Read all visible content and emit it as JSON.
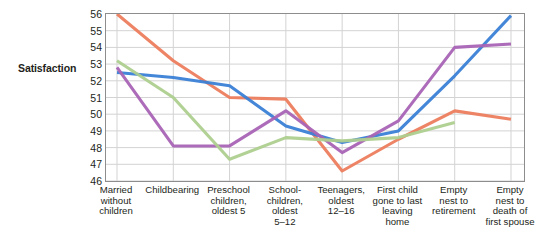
{
  "chart_data": {
    "type": "line",
    "title": "",
    "xlabel": "",
    "ylabel": "Satisfaction",
    "ylim": [
      46,
      56
    ],
    "yticks": [
      46,
      47,
      48,
      49,
      50,
      51,
      52,
      53,
      54,
      55,
      56
    ],
    "grid": true,
    "legend_position": "none",
    "categories": [
      "Married without children",
      "Childbearing",
      "Preschool children, oldest 5",
      "School-children, oldest 5–12",
      "Teenagers, oldest 12–16",
      "First child gone to last leaving home",
      "Empty nest to retirement",
      "Empty nest to death of first spouse"
    ],
    "category_lines": [
      [
        "Married",
        "without",
        "children"
      ],
      [
        "Childbearing"
      ],
      [
        "Preschool",
        "children,",
        "oldest 5"
      ],
      [
        "School-",
        "children,",
        "oldest",
        "5–12"
      ],
      [
        "Teenagers,",
        "oldest",
        "12–16"
      ],
      [
        "First child",
        "gone to last",
        "leaving",
        "home"
      ],
      [
        "Empty",
        "nest to",
        "retirement"
      ],
      [
        "Empty",
        "nest to",
        "death of",
        "first spouse"
      ]
    ],
    "series": [
      {
        "name": "series-orange",
        "color": "#ed7d5e",
        "values": [
          56.0,
          53.2,
          51.0,
          50.9,
          46.6,
          48.5,
          50.2,
          49.7
        ]
      },
      {
        "name": "series-blue",
        "color": "#3a7fd5",
        "values": [
          52.5,
          52.2,
          51.7,
          49.3,
          48.3,
          49.0,
          52.3,
          55.9
        ]
      },
      {
        "name": "series-purple",
        "color": "#a964b5",
        "values": [
          52.8,
          48.1,
          48.1,
          50.2,
          47.7,
          49.6,
          54.0,
          54.2
        ]
      },
      {
        "name": "series-green",
        "color": "#aecf8f",
        "values": [
          53.2,
          51.0,
          47.3,
          48.6,
          48.4,
          48.6,
          49.5,
          null
        ]
      }
    ]
  },
  "axis": {
    "y_title": "Satisfaction",
    "y_tick_labels": [
      "56",
      "55",
      "54",
      "53",
      "52",
      "51",
      "50",
      "49",
      "48",
      "47",
      "46"
    ]
  }
}
